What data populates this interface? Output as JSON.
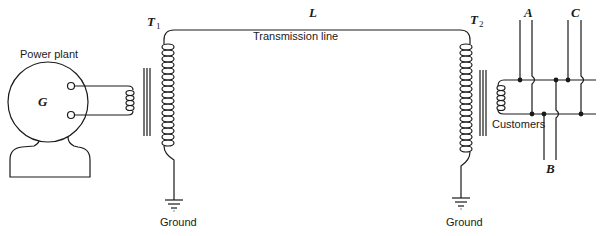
{
  "diagram": {
    "type": "power transmission system schematic",
    "power_plant": {
      "label": "Power plant",
      "generator_label": "G"
    },
    "step_up_transformer": {
      "label": "T",
      "subscript": "1"
    },
    "transmission_line": {
      "symbol": "L",
      "label": "Transmission line"
    },
    "step_down_transformer": {
      "label": "T",
      "subscript": "2"
    },
    "grounds": [
      {
        "label": "Ground"
      },
      {
        "label": "Ground"
      }
    ],
    "customers": {
      "label": "Customers",
      "taps": [
        {
          "label": "A"
        },
        {
          "label": "B"
        },
        {
          "label": "C"
        }
      ]
    },
    "colors": {
      "ink": "#1a1a1a",
      "background": "#ffffff"
    }
  }
}
